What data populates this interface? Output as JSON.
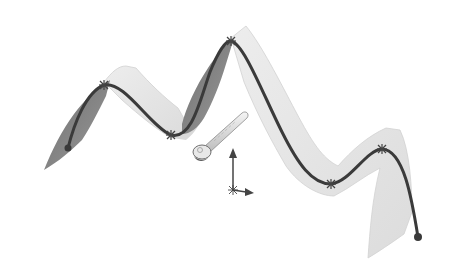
{
  "scene": {
    "description": "3D swept surface along a wavy guide curve with control points and a manipulator triad",
    "colors": {
      "background": "#ffffff",
      "surface_light": "#e6e6e6",
      "surface_light_edge": "#d2d2d2",
      "surface_dark": "#7e7e7e",
      "surface_dark2": "#959595",
      "curve": "#3a3a3a",
      "marker": "#444444",
      "triad": "#444444",
      "handle": "#d8d8d8",
      "handle_edge": "#8a8a8a"
    },
    "curve_points": [
      {
        "name": "start",
        "x": 68,
        "y": 148,
        "type": "endpoint"
      },
      {
        "name": "p1",
        "x": 104,
        "y": 85,
        "type": "knot"
      },
      {
        "name": "p2",
        "x": 171,
        "y": 135,
        "type": "knot"
      },
      {
        "name": "p3",
        "x": 231,
        "y": 41,
        "type": "knot"
      },
      {
        "name": "p4",
        "x": 331,
        "y": 184,
        "type": "knot"
      },
      {
        "name": "p5",
        "x": 382,
        "y": 149,
        "type": "knot"
      },
      {
        "name": "end",
        "x": 418,
        "y": 237,
        "type": "endpoint"
      }
    ],
    "manipulator": {
      "handle_tip": {
        "x": 245,
        "y": 116
      },
      "handle_base": {
        "x": 202,
        "y": 150
      },
      "triad_origin": {
        "x": 233,
        "y": 190
      },
      "axis_up_tip": {
        "x": 233,
        "y": 148
      },
      "axis_right_tip": {
        "x": 253,
        "y": 193
      }
    }
  }
}
